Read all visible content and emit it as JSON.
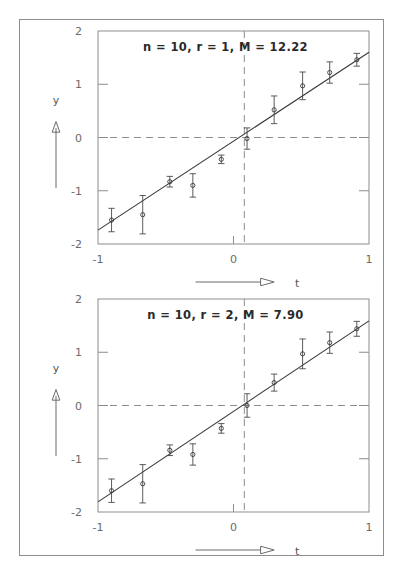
{
  "figure": {
    "background_color": "#ffffff",
    "border_color": "#8d8d8d",
    "line_color": "#3a3a3a",
    "grid_color": "#8d8d8d"
  },
  "panels": [
    {
      "id": "top",
      "title": "n  =  10,  r  =  1,  M  =      12.22",
      "ylabel": "y",
      "xlabel": "t",
      "y_ticks": [
        "2",
        "1",
        "0",
        "-1",
        "-2"
      ],
      "x_ticks": [
        "-1",
        "0",
        "1"
      ]
    },
    {
      "id": "bottom",
      "title": "n  =  10,  r  =  2,  M  =      7.90",
      "ylabel": "y",
      "xlabel": "t",
      "y_ticks": [
        "2",
        "1",
        "0",
        "-1",
        "-2"
      ],
      "x_ticks": [
        "-1",
        "0",
        "1"
      ]
    }
  ],
  "chart_data": [
    {
      "type": "scatter",
      "id": "panel-top",
      "title": "n = 10, r = 1, M = 12.22",
      "annotations": {
        "n": 10,
        "r": 1,
        "M": 12.22
      },
      "xlabel": "t",
      "ylabel": "y",
      "xlim": [
        -1,
        1
      ],
      "ylim": [
        -2,
        2
      ],
      "xticks": [
        -1,
        0,
        1
      ],
      "yticks": [
        -2,
        -1,
        0,
        1,
        2
      ],
      "grid": false,
      "reference_lines": [
        {
          "axis": "horizontal",
          "value": 0,
          "style": "dashed"
        },
        {
          "axis": "vertical",
          "value": 0.08,
          "style": "dashed"
        }
      ],
      "fit_line": {
        "slope": 1.67,
        "intercept": -0.07,
        "style": "solid"
      },
      "x": [
        -0.9,
        -0.67,
        -0.47,
        -0.3,
        -0.09,
        0.1,
        0.3,
        0.51,
        0.71,
        0.91
      ],
      "y": [
        -1.55,
        -1.45,
        -0.83,
        -0.9,
        -0.41,
        -0.02,
        0.52,
        0.97,
        1.22,
        1.46
      ],
      "yerr": [
        0.22,
        0.36,
        0.1,
        0.22,
        0.08,
        0.2,
        0.26,
        0.26,
        0.2,
        0.12
      ],
      "marker": "open-circle",
      "legend": null
    },
    {
      "type": "scatter",
      "id": "panel-bottom",
      "title": "n = 10, r = 2, M = 7.90",
      "annotations": {
        "n": 10,
        "r": 2,
        "M": 7.9
      },
      "xlabel": "t",
      "ylabel": "y",
      "xlim": [
        -1,
        1
      ],
      "ylim": [
        -2,
        2
      ],
      "xticks": [
        -1,
        0,
        1
      ],
      "yticks": [
        -2,
        -1,
        0,
        1,
        2
      ],
      "grid": false,
      "reference_lines": [
        {
          "axis": "horizontal",
          "value": 0,
          "style": "dashed"
        },
        {
          "axis": "vertical",
          "value": 0.08,
          "style": "dashed"
        }
      ],
      "fit_line": {
        "slope": 1.7,
        "intercept": -0.11,
        "style": "solid"
      },
      "x": [
        -0.9,
        -0.67,
        -0.47,
        -0.3,
        -0.09,
        0.1,
        0.3,
        0.51,
        0.71,
        0.91
      ],
      "y": [
        -1.6,
        -1.47,
        -0.84,
        -0.92,
        -0.43,
        0.0,
        0.43,
        0.97,
        1.18,
        1.44
      ],
      "yerr": [
        0.22,
        0.36,
        0.1,
        0.2,
        0.09,
        0.22,
        0.16,
        0.28,
        0.2,
        0.14
      ],
      "marker": "open-circle",
      "legend": null
    }
  ]
}
